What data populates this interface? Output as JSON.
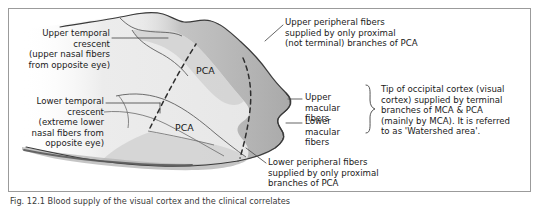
{
  "figure": {
    "frame": {
      "border_color": "#9b9b9b",
      "background": "#ffffff"
    },
    "caption": "Fig. 12.1 Blood supply of the visual cortex and the clinical correlates"
  },
  "diagram": {
    "type": "anatomical-illustration",
    "colors": {
      "outer_band": "#a9a9a9",
      "mid_band": "#c9c9c9",
      "inner_field": "#e9e9e9",
      "pale_field": "#f2f2f2",
      "outline": "#3a3a3a",
      "dashed_line": "#2e2e2e",
      "leader_line": "#4a4a4a"
    },
    "internal_labels": [
      {
        "name": "pca-upper",
        "text": "PCA"
      },
      {
        "name": "pca-lower",
        "text": "PCA"
      }
    ]
  },
  "labels": {
    "upper_temporal_crescent": "Upper temporal\ncrescent\n(upper nasal fibers\nfrom opposite eye)",
    "lower_temporal_crescent": "Lower temporal\ncrescent\n(extreme lower\nnasal fibers from\nopposite eye)",
    "upper_peripheral_fibers": "Upper peripheral fibers\nsupplied by only proximal\n(not terminal) branches of PCA",
    "lower_peripheral_fibers": "Lower peripheral fibers\nsupplied by only proximal\nbranches of PCA",
    "upper_macular_fibers": "Upper macular\nfibers",
    "lower_macular_fibers": "Lower macular\nfibers",
    "watershed_note": "Tip of occipital cortex  (visual\ncortex) supplied by terminal\nbranches of MCA & PCA\n(mainly by MCA). It is referred\nto as 'Watershed area'."
  }
}
